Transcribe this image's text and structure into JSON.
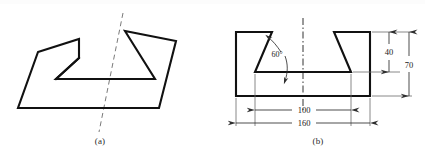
{
  "figure": {
    "type": "engineering-drawing",
    "background_color": "#ffffff",
    "line_color": "#111111",
    "dimension_color": "#2e2e2e",
    "panels": [
      {
        "id": "a",
        "caption": "(a)",
        "description": "pictorial view of notched block with dashed section axis",
        "has_dashed_axis": true,
        "dimensions": []
      },
      {
        "id": "b",
        "caption": "(b)",
        "description": "front orthographic view of block with symmetric dovetail notch",
        "has_centerline": true,
        "dimensions": [
          {
            "name": "notch-angle",
            "value": "60",
            "unit_symbol": "°",
            "label": "60°"
          },
          {
            "name": "notch-depth",
            "value": "40",
            "label": "40"
          },
          {
            "name": "overall-height",
            "value": "70",
            "label": "70"
          },
          {
            "name": "notch-width",
            "value": "100",
            "label": "100"
          },
          {
            "name": "overall-width",
            "value": "160",
            "label": "160"
          }
        ]
      }
    ]
  },
  "panel_a": {
    "caption": "(a)"
  },
  "panel_b": {
    "caption": "(b)",
    "angle_label": "60°",
    "depth_label": "40",
    "height_label": "70",
    "inner_width_label": "100",
    "outer_width_label": "160"
  }
}
